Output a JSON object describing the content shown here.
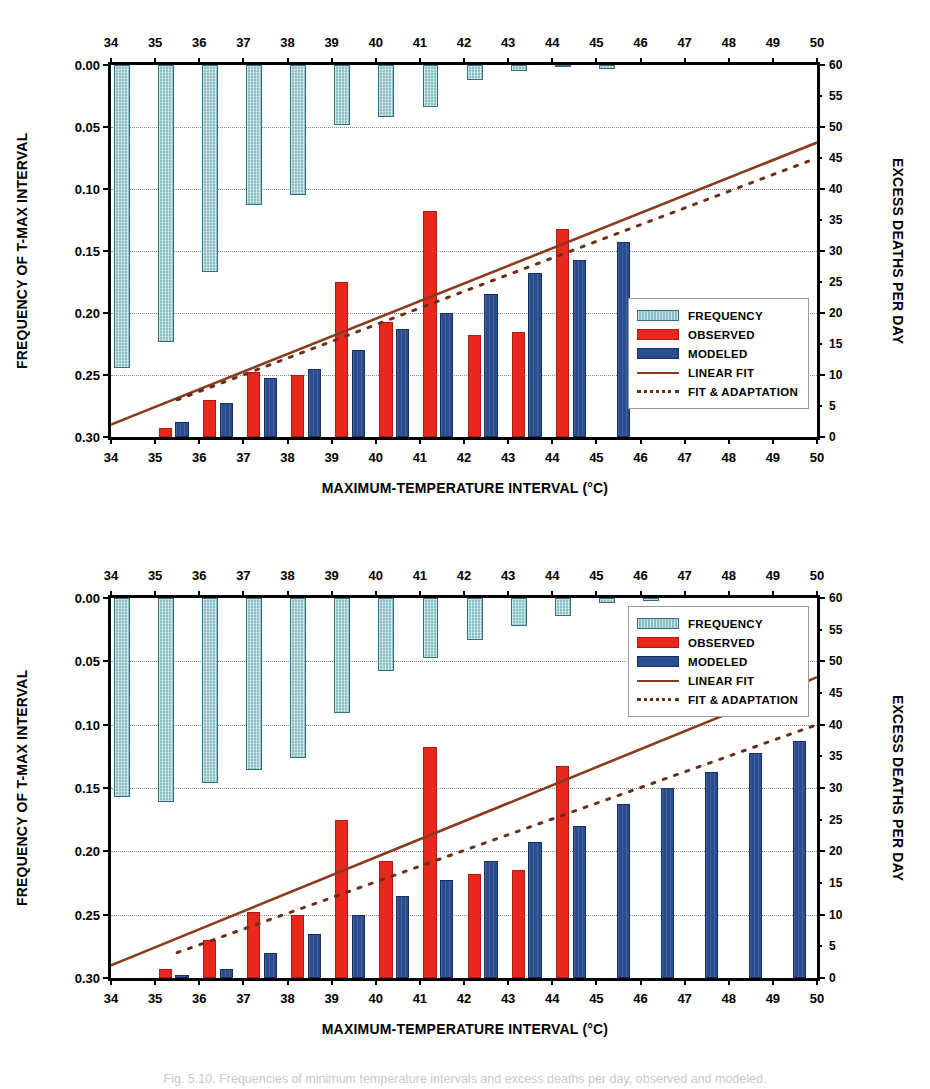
{
  "figure": {
    "caption": "Fig. 5.10. Frequencies of minimum temperature intervals and excess deaths per day, observed and modeled."
  },
  "axes": {
    "x_title": "MAXIMUM-TEMPERATURE INTERVAL (°C)",
    "y_left_title": "FREQUENCY OF T-MAX INTERVAL",
    "y_right_title": "EXCESS DEATHS PER DAY",
    "x_ticks": [
      34,
      35,
      36,
      37,
      38,
      39,
      40,
      41,
      42,
      43,
      44,
      45,
      46,
      47,
      48,
      49,
      50
    ],
    "y_left_ticks": [
      "0.00",
      "0.05",
      "0.10",
      "0.15",
      "0.20",
      "0.25",
      "0.30"
    ],
    "y_right_ticks": [
      60,
      55,
      50,
      45,
      40,
      35,
      30,
      25,
      20,
      15,
      10,
      5,
      0
    ],
    "y_left_range": [
      0.0,
      0.3
    ],
    "y_right_range": [
      0,
      60
    ],
    "x_range": [
      34,
      50
    ]
  },
  "legend": {
    "items": [
      {
        "label": "FREQUENCY",
        "style": "freq",
        "color": "#86c0c6"
      },
      {
        "label": "OBSERVED",
        "style": "obs",
        "color": "#e8281c"
      },
      {
        "label": "MODELED",
        "style": "mod",
        "color": "#2a4d8f"
      },
      {
        "label": "LINEAR FIT",
        "style": "line",
        "color": "#8a3b1e"
      },
      {
        "label": "FIT & ADAPTATION",
        "style": "dash",
        "color": "#6b2f17"
      }
    ]
  },
  "chart_data": [
    {
      "type": "bar",
      "panel": "top",
      "title": "",
      "xlabel": "MAXIMUM-TEMPERATURE INTERVAL (°C)",
      "ylabel": "FREQUENCY OF T-MAX INTERVAL",
      "ylabel_right": "EXCESS DEATHS PER DAY",
      "categories": [
        34,
        35,
        36,
        37,
        38,
        39,
        40,
        41,
        42,
        43,
        44,
        45,
        46,
        47,
        48,
        49,
        50
      ],
      "ylim": [
        0.3,
        0.0
      ],
      "ylim_right": [
        0,
        60
      ],
      "grid": true,
      "legend_position": "bottom-right",
      "series": [
        {
          "name": "FREQUENCY",
          "axis": "left",
          "direction": "down-from-zero",
          "values": [
            0.244,
            0.223,
            0.167,
            0.113,
            0.105,
            0.048,
            0.042,
            0.034,
            0.012,
            0.005,
            0.002,
            0.003,
            null,
            null,
            null,
            null,
            null
          ]
        },
        {
          "name": "OBSERVED",
          "axis": "right",
          "values": [
            null,
            1.5,
            6.0,
            10.5,
            10.0,
            25.0,
            18.5,
            36.5,
            16.5,
            17.0,
            33.5,
            null,
            null,
            null,
            null,
            null,
            null
          ]
        },
        {
          "name": "MODELED",
          "axis": "right",
          "values": [
            null,
            2.5,
            5.5,
            9.5,
            11.0,
            14.0,
            17.5,
            20.0,
            23.0,
            26.5,
            28.5,
            31.5,
            null,
            null,
            null,
            null,
            null
          ]
        },
        {
          "name": "LINEAR FIT",
          "axis": "right",
          "type": "line",
          "x": [
            34,
            50
          ],
          "y": [
            2.0,
            47.5
          ]
        },
        {
          "name": "FIT & ADAPTATION",
          "axis": "right",
          "type": "dashed-line",
          "x": [
            35.5,
            50
          ],
          "y": [
            6.0,
            45.0
          ]
        }
      ]
    },
    {
      "type": "bar",
      "panel": "bottom",
      "title": "",
      "xlabel": "MAXIMUM-TEMPERATURE INTERVAL (°C)",
      "ylabel": "FREQUENCY OF T-MAX INTERVAL",
      "ylabel_right": "EXCESS DEATHS PER DAY",
      "categories": [
        34,
        35,
        36,
        37,
        38,
        39,
        40,
        41,
        42,
        43,
        44,
        45,
        46,
        47,
        48,
        49,
        50
      ],
      "ylim": [
        0.3,
        0.0
      ],
      "ylim_right": [
        0,
        60
      ],
      "grid": true,
      "legend_position": "top-right",
      "series": [
        {
          "name": "FREQUENCY",
          "axis": "left",
          "direction": "down-from-zero",
          "values": [
            0.157,
            0.161,
            0.146,
            0.136,
            0.126,
            0.091,
            0.058,
            0.047,
            0.033,
            0.022,
            0.014,
            0.004,
            0.002,
            null,
            null,
            null,
            null
          ]
        },
        {
          "name": "OBSERVED",
          "axis": "right",
          "values": [
            null,
            1.5,
            6.0,
            10.5,
            10.0,
            25.0,
            18.5,
            36.5,
            16.5,
            17.0,
            33.5,
            null,
            null,
            null,
            null,
            null,
            null
          ]
        },
        {
          "name": "MODELED",
          "axis": "right",
          "values": [
            null,
            0.5,
            1.5,
            4.0,
            7.0,
            10.0,
            13.0,
            15.5,
            18.5,
            21.5,
            24.0,
            27.5,
            30.0,
            32.5,
            35.5,
            37.5,
            null
          ]
        },
        {
          "name": "LINEAR FIT",
          "axis": "right",
          "type": "line",
          "x": [
            34,
            50
          ],
          "y": [
            2.0,
            47.5
          ]
        },
        {
          "name": "FIT & ADAPTATION",
          "axis": "right",
          "type": "dashed-line",
          "x": [
            35.5,
            50
          ],
          "y": [
            4.0,
            40.0
          ]
        }
      ]
    }
  ]
}
